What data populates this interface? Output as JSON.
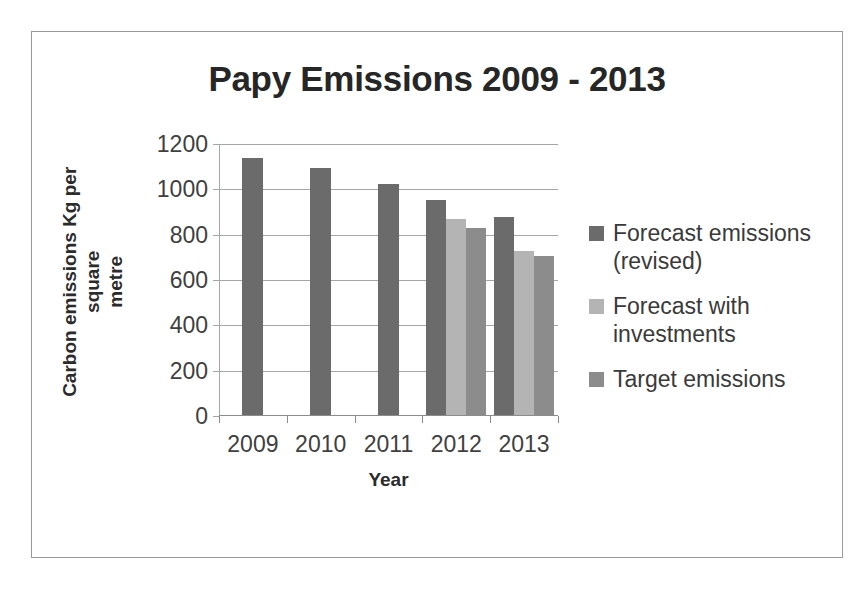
{
  "chart_data": {
    "type": "bar",
    "title": "Papy Emissions 2009 - 2013",
    "xlabel": "Year",
    "ylabel": "Carbon emissions Kg per square metre",
    "ylabel_lines": [
      "Carbon emissions Kg per square",
      "metre"
    ],
    "categories": [
      "2009",
      "2010",
      "2011",
      "2012",
      "2013"
    ],
    "ylim": [
      0,
      1200
    ],
    "yticks": [
      0,
      200,
      400,
      600,
      800,
      1000,
      1200
    ],
    "ytick_labels": [
      "0",
      "200",
      "400",
      "600",
      "800",
      "1000",
      "1200"
    ],
    "grid": true,
    "grid_axis": "y",
    "legend_position": "right",
    "series": [
      {
        "name": "Forecast emissions (revised)",
        "color": "#6b6b6b",
        "values": [
          1135,
          1090,
          1020,
          950,
          875
        ]
      },
      {
        "name": "Forecast with investments",
        "color": "#b4b4b4",
        "values": [
          null,
          null,
          null,
          865,
          725
        ]
      },
      {
        "name": "Target emissions",
        "color": "#8c8c8c",
        "values": [
          null,
          null,
          null,
          825,
          700
        ]
      }
    ]
  },
  "legend": {
    "items": [
      {
        "label_lines": [
          "Forecast emissions",
          "(revised)"
        ],
        "color": "#6b6b6b"
      },
      {
        "label_lines": [
          "Forecast with",
          "investments"
        ],
        "color": "#b4b4b4"
      },
      {
        "label_lines": [
          "Target emissions"
        ],
        "color": "#8c8c8c"
      }
    ]
  },
  "frame": {
    "border_color": "#9a9a9a",
    "background": "#ffffff"
  }
}
